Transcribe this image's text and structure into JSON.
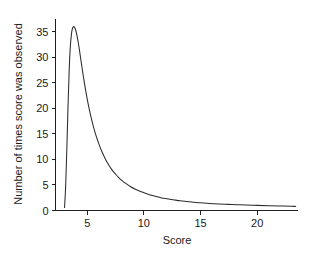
{
  "chart_data": {
    "type": "line",
    "title": "",
    "xlabel": "Score",
    "ylabel": "Number of times score was observed",
    "xlim": [
      2.2,
      23.6
    ],
    "ylim": [
      0,
      37.5
    ],
    "grid": false,
    "legend": null,
    "xticks": [
      5,
      10,
      15,
      20
    ],
    "xtick_labels": [
      "5",
      "10",
      "15",
      "20"
    ],
    "yticks": [
      0,
      5,
      10,
      15,
      20,
      25,
      30,
      35
    ],
    "ytick_labels": [
      "0",
      "5",
      "10",
      "15",
      "20",
      "25",
      "30",
      "35"
    ],
    "line_color": "#2b2b2b",
    "background_color": "#ffffff",
    "axis_color": "#1f1f1f",
    "series": [
      {
        "name": "Score frequency",
        "x": [
          3.0,
          3.1,
          3.2,
          3.3,
          3.4,
          3.5,
          3.6,
          3.7,
          3.8,
          3.9,
          4.0,
          4.1,
          4.2,
          4.3,
          4.4,
          4.5,
          4.6,
          4.8,
          5.0,
          5.2,
          5.4,
          5.6,
          5.8,
          6.0,
          6.3,
          6.6,
          6.9,
          7.2,
          7.5,
          7.8,
          8.1,
          8.4,
          8.8,
          9.2,
          9.6,
          10.0,
          10.5,
          11.0,
          11.5,
          12.0,
          12.6,
          13.2,
          13.8,
          14.4,
          15.0,
          15.8,
          16.6,
          17.4,
          18.2,
          19.0,
          20.0,
          21.0,
          22.0,
          23.0,
          23.4
        ],
        "y": [
          0.6,
          5.0,
          12.0,
          20.0,
          27.0,
          31.8,
          34.4,
          35.7,
          36.0,
          35.8,
          35.2,
          34.2,
          33.0,
          31.6,
          30.1,
          28.6,
          27.1,
          24.3,
          21.8,
          19.6,
          17.7,
          16.0,
          14.5,
          13.2,
          11.5,
          10.1,
          8.9,
          7.9,
          7.1,
          6.4,
          5.8,
          5.3,
          4.7,
          4.2,
          3.8,
          3.5,
          3.1,
          2.8,
          2.5,
          2.3,
          2.1,
          1.9,
          1.75,
          1.6,
          1.5,
          1.38,
          1.28,
          1.2,
          1.13,
          1.07,
          1.0,
          0.94,
          0.88,
          0.83,
          0.8
        ]
      }
    ],
    "peak": {
      "x": 3.8,
      "y": 36.0
    }
  },
  "axes": {
    "x_title": "Score",
    "y_title": "Number of times score was observed"
  }
}
